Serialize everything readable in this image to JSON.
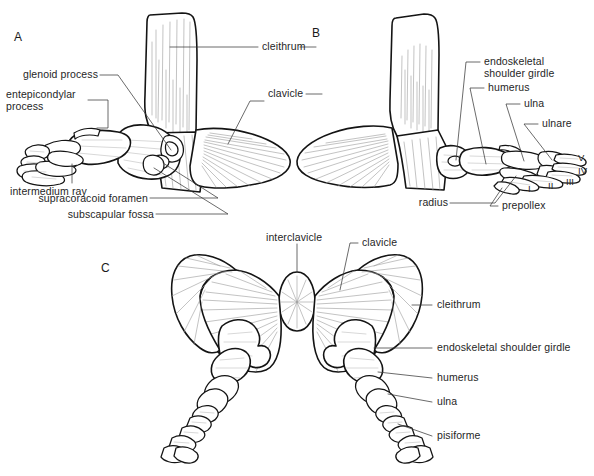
{
  "figure": {
    "panels": [
      {
        "id": "A",
        "label": "A"
      },
      {
        "id": "B",
        "label": "B"
      },
      {
        "id": "C",
        "label": "C"
      }
    ],
    "ink_color": "#1a1a1a",
    "text_color": "#262626",
    "hatch_color": "#8a8a8a",
    "background": "#ffffff"
  },
  "panel_a": {
    "label": "A",
    "labels": {
      "cleithrum": "cleithrum",
      "clavicle": "clavicle",
      "glenoid_process": "glenoid process",
      "entepicondylar_process": "entepicondylar\nprocess",
      "intermedium_ray": "intermedium ray",
      "supracoracoid_foramen": "supracoracoid foramen",
      "subscapular_fossa": "subscapular fossa"
    }
  },
  "panel_b": {
    "label": "B",
    "labels": {
      "endoskeletal_shoulder_girdle": "endoskeletal\nshoulder girdle",
      "humerus": "humerus",
      "ulna": "ulna",
      "ulnare": "ulnare",
      "radius": "radius",
      "prepollex": "prepollex"
    },
    "digits": [
      "I",
      "II",
      "III",
      "IV",
      "V"
    ]
  },
  "panel_c": {
    "label": "C",
    "labels": {
      "interclavicle": "interclavicle",
      "clavicle": "clavicle",
      "cleithrum": "cleithrum",
      "endoskeletal_shoulder_girdle": "endoskeletal shoulder girdle",
      "humerus": "humerus",
      "ulna": "ulna",
      "pisiforme": "pisiforme"
    }
  },
  "caption": {
    "text": ""
  }
}
